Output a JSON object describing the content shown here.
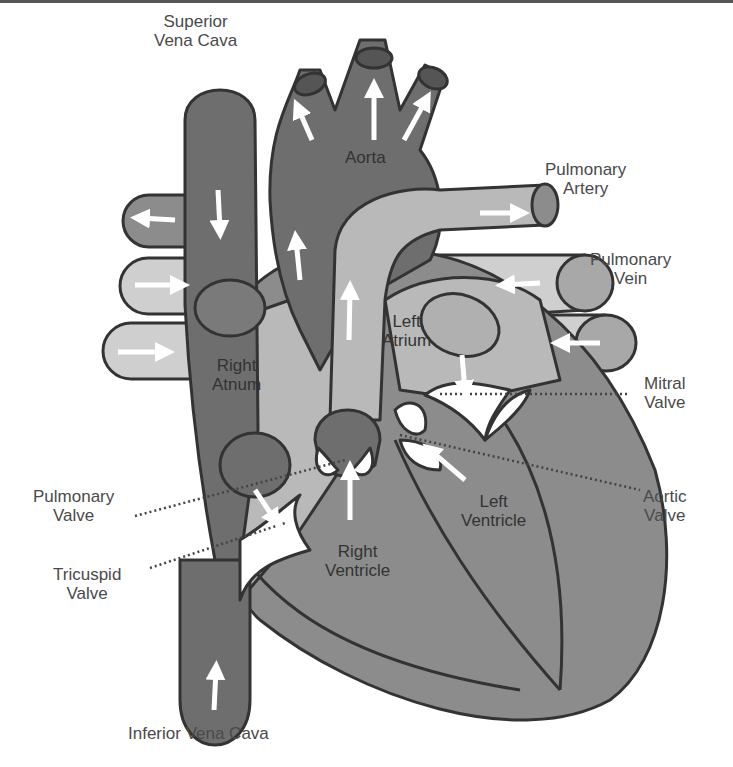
{
  "diagram": {
    "type": "heart-anatomy",
    "colors": {
      "dark": "#6e6e6e",
      "medium": "#8c8c8c",
      "light": "#b9b9b9",
      "lighter": "#cfcfcf",
      "outline": "#333333",
      "arrow": "#ffffff",
      "text": "#4a4a4a"
    },
    "labels": {
      "superior_vena_cava": [
        "Superior",
        "Vena Cava"
      ],
      "aorta": "Aorta",
      "pulmonary_artery": [
        "Pulmonary",
        "Artery"
      ],
      "pulmonary_vein": [
        "Pulmonary",
        "Vein"
      ],
      "left_atrium": [
        "Left",
        "Atrium"
      ],
      "right_atrium": [
        "Right",
        "Atnum"
      ],
      "mitral_valve": [
        "Mitral",
        "Valve"
      ],
      "pulmonary_valve": [
        "Pulmonary",
        "Valve"
      ],
      "aortic_valve": [
        "Aortic",
        "Valve"
      ],
      "left_ventricle": [
        "Left",
        "Ventricle"
      ],
      "right_ventricle": [
        "Right",
        "Ventricle"
      ],
      "tricuspid_valve": [
        "Tricuspid",
        "Valve"
      ],
      "inferior_vena_cava": "Inferior Vena Cava"
    }
  }
}
